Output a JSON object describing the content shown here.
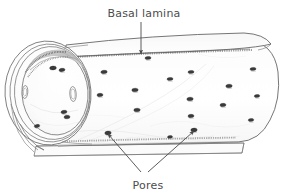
{
  "figure": {
    "name": "fenestrated-capillary-diagram",
    "type": "biological-illustration",
    "background_color": "#ffffff",
    "ink_color": "#555555",
    "text_color": "#4c4c4c",
    "pore_color": "#3a3a3a"
  },
  "labels": {
    "basal_lamina": {
      "text": "Basal lamina",
      "x": 144,
      "y": 17,
      "anchor": "middle"
    },
    "pores": {
      "text": "Pores",
      "x": 148,
      "y": 189,
      "anchor": "middle"
    }
  },
  "leaders": {
    "basal_lamina_arrow": {
      "name": "basal-lamina-arrow",
      "from_x": 141,
      "from_y": 22,
      "to_x": 141,
      "to_y": 54
    },
    "pores_arrows": [
      {
        "name": "pores-arrow-left",
        "from_x": 141,
        "from_y": 172,
        "to_x": 108,
        "to_y": 134
      },
      {
        "name": "pores-arrow-right",
        "from_x": 148,
        "from_y": 172,
        "to_x": 194,
        "to_y": 131
      }
    ]
  },
  "structures": {
    "tube_body": "endothelial-tube",
    "left_cross_section": "capillary-lumen-cross-section",
    "basal_lamina_top_sheet": "basal-lamina-upper-sheet",
    "basal_lamina_bottom_sheet": "basal-lamina-lower-sheet",
    "right_end_cap": "tube-right-end-cap"
  },
  "pores_on_surface": [
    {
      "x": 148,
      "y": 58,
      "rx": 3.0,
      "ry": 1.6,
      "rot": -4
    },
    {
      "x": 104,
      "y": 72,
      "rx": 3.2,
      "ry": 1.7,
      "rot": -6
    },
    {
      "x": 191,
      "y": 72,
      "rx": 3.0,
      "ry": 1.6,
      "rot": -4
    },
    {
      "x": 253,
      "y": 69,
      "rx": 3.0,
      "ry": 1.6,
      "rot": -4
    },
    {
      "x": 229,
      "y": 86,
      "rx": 3.2,
      "ry": 1.8,
      "rot": -5
    },
    {
      "x": 170,
      "y": 79,
      "rx": 3.0,
      "ry": 1.6,
      "rot": -4
    },
    {
      "x": 135,
      "y": 90,
      "rx": 3.2,
      "ry": 1.8,
      "rot": -4
    },
    {
      "x": 190,
      "y": 99,
      "rx": 3.2,
      "ry": 1.8,
      "rot": -5
    },
    {
      "x": 100,
      "y": 95,
      "rx": 3.0,
      "ry": 1.7,
      "rot": -4
    },
    {
      "x": 223,
      "y": 105,
      "rx": 3.0,
      "ry": 1.7,
      "rot": -4
    },
    {
      "x": 257,
      "y": 96,
      "rx": 2.8,
      "ry": 1.5,
      "rot": -4
    },
    {
      "x": 137,
      "y": 110,
      "rx": 3.2,
      "ry": 1.8,
      "rot": -4
    },
    {
      "x": 191,
      "y": 116,
      "rx": 3.0,
      "ry": 1.7,
      "rot": -4
    },
    {
      "x": 251,
      "y": 120,
      "rx": 2.8,
      "ry": 1.5,
      "rot": -4
    },
    {
      "x": 108,
      "y": 133,
      "rx": 3.2,
      "ry": 1.9,
      "rot": -6
    },
    {
      "x": 194,
      "y": 130,
      "rx": 3.2,
      "ry": 1.9,
      "rot": -6
    },
    {
      "x": 170,
      "y": 137,
      "rx": 2.6,
      "ry": 1.4,
      "rot": -4
    },
    {
      "x": 62,
      "y": 70,
      "rx": 3.0,
      "ry": 1.7,
      "rot": -8
    },
    {
      "x": 64,
      "y": 112,
      "rx": 3.0,
      "ry": 1.7,
      "rot": -8
    },
    {
      "x": 37,
      "y": 126,
      "rx": 2.8,
      "ry": 1.6,
      "rot": -10
    }
  ],
  "pores_in_section": [
    {
      "x": 25,
      "y": 92,
      "rx": 2.8,
      "ry": 6.5,
      "rot": 4
    },
    {
      "x": 73,
      "y": 94,
      "rx": 3.2,
      "ry": 7.5,
      "rot": -3
    },
    {
      "x": 53,
      "y": 68,
      "rx": 3.4,
      "ry": 1.9,
      "rot": -6
    },
    {
      "x": 67,
      "y": 117,
      "rx": 3.0,
      "ry": 1.8,
      "rot": -6
    }
  ]
}
